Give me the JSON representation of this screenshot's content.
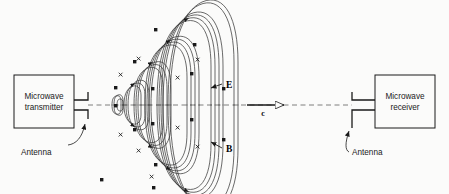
{
  "figure": {
    "background_color": "#fbfbfa",
    "ink_color": "#1a1a1a",
    "field_line_color": "#3a3a3a",
    "axis_color": "#707070"
  },
  "transmitter": {
    "label_line1": "Microwave",
    "label_line2": "transmitter",
    "antenna_label": "Antenna"
  },
  "receiver": {
    "label_line1": "Microwave",
    "label_line2": "receiver",
    "antenna_label": "Antenna"
  },
  "annotations": {
    "e_field_label": "E",
    "b_field_label": "B",
    "speed_label": "c"
  }
}
